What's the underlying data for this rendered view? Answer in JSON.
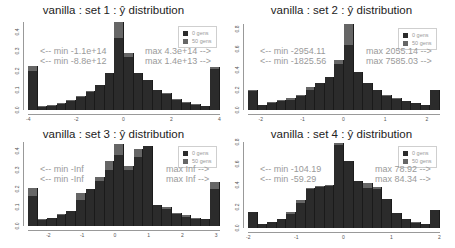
{
  "chart_data": [
    {
      "type": "bar",
      "title_prefix": "vanilla : set 1 : ",
      "title_symbol": "ŷ",
      "title_suffix": " distribution",
      "title": "vanilla : set 1 : ŷ distribution",
      "xlabel": "",
      "ylabel": "",
      "xlim": [
        -4,
        4
      ],
      "ylim": [
        0,
        0.45
      ],
      "xticks": [
        -4,
        -2,
        0,
        2,
        4
      ],
      "yticks": [
        0.0,
        0.1,
        0.2,
        0.3,
        0.4
      ],
      "ytick_labels": [
        "0.0",
        "0.1",
        "0.2",
        "0.3",
        "0.4"
      ],
      "bin_edges_start": -4,
      "bin_width": 0.4,
      "series": [
        {
          "name": "0 gens",
          "color": "#2b2b2b",
          "values": [
            0.2,
            0.015,
            0.02,
            0.03,
            0.045,
            0.065,
            0.09,
            0.13,
            0.19,
            0.37,
            0.27,
            0.19,
            0.155,
            0.1,
            0.08,
            0.05,
            0.035,
            0.025,
            0.02,
            0.21
          ]
        },
        {
          "name": "50 gens",
          "color": "#666666",
          "values": [
            0.225,
            0.02,
            0.025,
            0.035,
            0.05,
            0.07,
            0.095,
            0.13,
            0.19,
            0.45,
            0.29,
            0.19,
            0.155,
            0.1,
            0.085,
            0.055,
            0.04,
            0.03,
            0.02,
            0.22
          ]
        }
      ],
      "legend": [
        "0 gens",
        "50 gens"
      ],
      "legend_position": "top-right",
      "annotations": {
        "min_0": "<-- min -1.1e+14",
        "min_50": "<-- min -8.8e+12",
        "max_0": "max 4.3e+14 -->",
        "max_50": "max 1.4e+13 -->"
      }
    },
    {
      "type": "bar",
      "title_prefix": "vanilla : set 2 : ",
      "title_symbol": "ŷ",
      "title_suffix": " distribution",
      "title": "vanilla : set 2 : ŷ distribution",
      "xlabel": "",
      "ylabel": "",
      "xlim": [
        -2.3,
        2.3
      ],
      "ylim": [
        0,
        0.85
      ],
      "xticks": [
        -2,
        -1,
        0,
        1,
        2
      ],
      "yticks": [
        0.0,
        0.2,
        0.4,
        0.6,
        0.8
      ],
      "ytick_labels": [
        "0.0",
        "0.2",
        "0.4",
        "0.6",
        "0.8"
      ],
      "bin_edges_start": -2.3,
      "bin_width": 0.23,
      "series": [
        {
          "name": "0 gens",
          "color": "#2b2b2b",
          "values": [
            0.19,
            0.05,
            0.07,
            0.09,
            0.1,
            0.14,
            0.2,
            0.27,
            0.33,
            0.45,
            0.64,
            0.38,
            0.27,
            0.2,
            0.14,
            0.11,
            0.09,
            0.07,
            0.05,
            0.2
          ]
        },
        {
          "name": "50 gens",
          "color": "#666666",
          "values": [
            0.2,
            0.05,
            0.075,
            0.095,
            0.12,
            0.15,
            0.23,
            0.27,
            0.33,
            0.49,
            0.85,
            0.38,
            0.27,
            0.2,
            0.15,
            0.12,
            0.09,
            0.07,
            0.05,
            0.2
          ]
        }
      ],
      "legend": [
        "0 gens",
        "50 gens"
      ],
      "legend_position": "top-right",
      "annotations": {
        "min_0": "<-- min -2954.11",
        "min_50": "<-- min -1825.56",
        "max_0": "max 2055.14 -->",
        "max_50": "max 7585.03 -->"
      }
    },
    {
      "type": "bar",
      "title_prefix": "vanilla : set 3 : ",
      "title_symbol": "ŷ",
      "title_suffix": " distribution",
      "title": "vanilla : set 3 : ŷ distribution",
      "xlabel": "",
      "ylabel": "",
      "xlim": [
        -2.6,
        3.1
      ],
      "ylim": [
        0,
        0.45
      ],
      "xticks": [
        -2,
        -1,
        0,
        1,
        2,
        3
      ],
      "yticks": [
        0.0,
        0.1,
        0.2,
        0.3,
        0.4
      ],
      "ytick_labels": [
        "0.0",
        "0.1",
        "0.2",
        "0.3",
        "0.4"
      ],
      "bin_edges_start": -2.6,
      "bin_width": 0.285,
      "series": [
        {
          "name": "0 gens",
          "color": "#2b2b2b",
          "values": [
            0.16,
            0.03,
            0.045,
            0.06,
            0.08,
            0.14,
            0.2,
            0.24,
            0.3,
            0.38,
            0.3,
            0.37,
            0.43,
            0.11,
            0.09,
            0.065,
            0.05,
            0.04,
            0.035,
            0.2
          ]
        },
        {
          "name": "50 gens",
          "color": "#666666",
          "values": [
            0.205,
            0.035,
            0.045,
            0.065,
            0.08,
            0.175,
            0.2,
            0.26,
            0.35,
            0.44,
            0.32,
            0.41,
            0.43,
            0.11,
            0.1,
            0.07,
            0.06,
            0.045,
            0.04,
            0.235
          ]
        }
      ],
      "legend": [
        "0 gens",
        "50 gens"
      ],
      "legend_position": "top-right",
      "annotations": {
        "min_0": "<-- min -Inf",
        "min_50": "<-- min -Inf",
        "max_0": "max Inf -->",
        "max_50": "max Inf -->"
      }
    },
    {
      "type": "bar",
      "title_prefix": "vanilla : set 4 : ",
      "title_symbol": "ŷ",
      "title_suffix": " distribution",
      "title": "vanilla : set 4 : ŷ distribution",
      "xlabel": "",
      "ylabel": "",
      "xlim": [
        -2,
        2
      ],
      "ylim": [
        0,
        0.8
      ],
      "xticks": [
        -2,
        -1,
        0,
        1,
        2
      ],
      "yticks": [
        0.0,
        0.2,
        0.4,
        0.6,
        0.8
      ],
      "ytick_labels": [
        "0.0",
        "0.2",
        "0.4",
        "0.6",
        "0.8"
      ],
      "bin_edges_start": -1.9,
      "bin_width": 0.2,
      "series": [
        {
          "name": "0 gens",
          "color": "#2b2b2b",
          "values": [
            0.15,
            0.04,
            0.06,
            0.08,
            0.13,
            0.23,
            0.36,
            0.38,
            0.39,
            0.77,
            0.62,
            0.44,
            0.37,
            0.36,
            0.27,
            0.14,
            0.08,
            0.05,
            0.04,
            0.17
          ]
        },
        {
          "name": "50 gens",
          "color": "#666666",
          "values": [
            0.15,
            0.04,
            0.06,
            0.08,
            0.15,
            0.26,
            0.37,
            0.39,
            0.4,
            0.79,
            0.62,
            0.44,
            0.42,
            0.38,
            0.27,
            0.14,
            0.08,
            0.06,
            0.04,
            0.17
          ]
        }
      ],
      "legend": [
        "0 gens",
        "50 gens"
      ],
      "legend_position": "top-right",
      "annotations": {
        "min_0": "<-- min -104.19",
        "min_50": "<-- min -59.29",
        "max_0": "max 78.92 -->",
        "max_50": "max 84.34 -->"
      }
    }
  ],
  "layout": {
    "panels": [
      {
        "left": 0,
        "top": 0,
        "plot": {
          "x": 28,
          "y": 22,
          "w": 192,
          "h": 88
        },
        "ann_min_x": 40,
        "ann_max_x": 145,
        "ann_y": 46
      },
      {
        "left": 228,
        "top": 0,
        "plot": {
          "x": 20,
          "y": 24,
          "w": 192,
          "h": 86
        },
        "ann_min_x": 32,
        "ann_max_x": 138,
        "ann_y": 46
      },
      {
        "left": 0,
        "top": 124,
        "plot": {
          "x": 28,
          "y": 18,
          "w": 192,
          "h": 84
        },
        "ann_min_x": 40,
        "ann_max_x": 166,
        "ann_y": 40
      },
      {
        "left": 228,
        "top": 124,
        "plot": {
          "x": 20,
          "y": 18,
          "w": 192,
          "h": 86
        },
        "ann_min_x": 32,
        "ann_max_x": 147,
        "ann_y": 40
      }
    ]
  }
}
